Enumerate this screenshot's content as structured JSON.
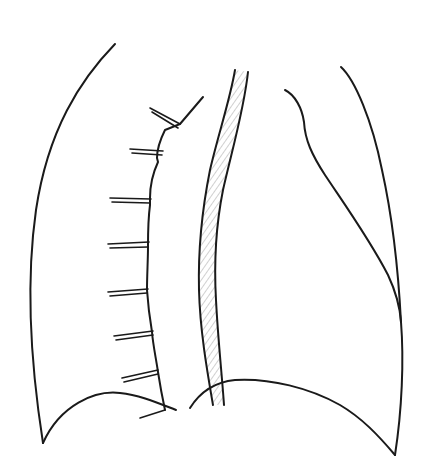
{
  "diagram": {
    "type": "line-art anatomical sketch",
    "style": {
      "ink_color": "#1a1a1a",
      "background": "#ffffff",
      "hatch_color": "#8a8a8a"
    },
    "elements": [
      {
        "id": "left-outer-contour",
        "description": "left outer curved outline from top to bottom-left point"
      },
      {
        "id": "left-inner-border",
        "description": "jagged inner border with rib-like spurs"
      },
      {
        "id": "rib-spurs",
        "count": 8,
        "description": "double-line short horizontal spurs projecting left"
      },
      {
        "id": "central-hatched-band",
        "description": "narrow diagonally hatched vertical band"
      },
      {
        "id": "right-inner-contour",
        "description": "S-curve from upper center to right lower point"
      },
      {
        "id": "right-outer-contour",
        "description": "right outer outline curving down to bottom-right point"
      },
      {
        "id": "left-base-curve",
        "description": "lower left dome-shaped base curve"
      },
      {
        "id": "right-base-curve",
        "description": "lower right base curve"
      }
    ]
  }
}
